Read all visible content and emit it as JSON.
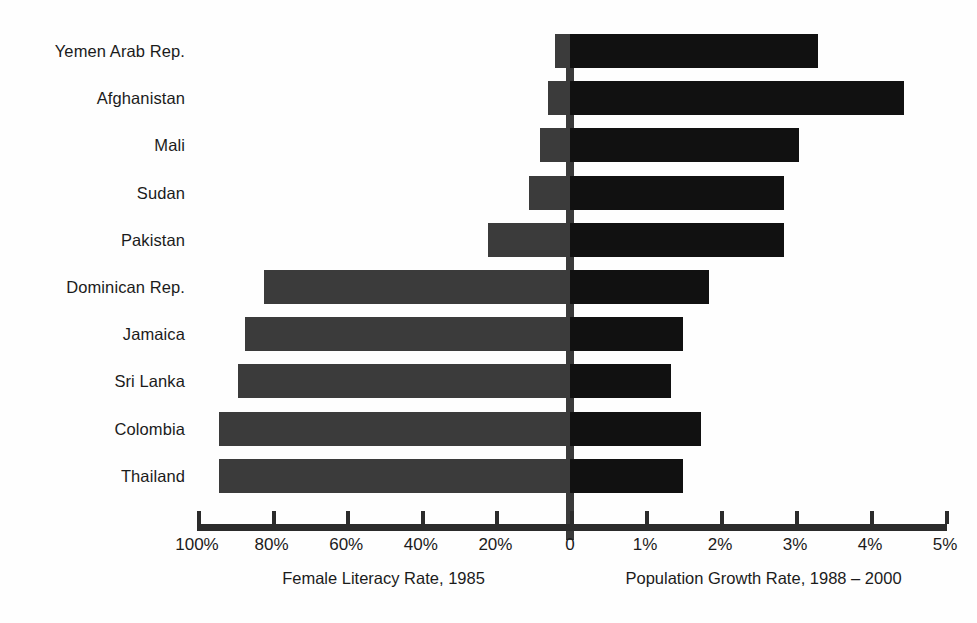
{
  "chart_data": {
    "type": "bar",
    "title": "",
    "orientation": "horizontal",
    "style": "diverging-bidirectional",
    "categories": [
      "Yemen Arab Rep.",
      "Afghanistan",
      "Mali",
      "Sudan",
      "Pakistan",
      "Dominican Rep.",
      "Jamaica",
      "Sri Lanka",
      "Colombia",
      "Thailand"
    ],
    "series": [
      {
        "name": "Female Literacy Rate, 1985",
        "side": "left",
        "unit": "%",
        "axis_label": "Female Literacy Rate, 1985",
        "color": "#3b3b3b",
        "values": [
          4,
          6,
          8,
          11,
          22,
          82,
          87,
          89,
          94,
          94
        ]
      },
      {
        "name": "Population Growth Rate, 1988 – 2000",
        "side": "right",
        "unit": "%",
        "axis_label": "Population Growth  Rate, 1988 – 2000",
        "color": "#111111",
        "values": [
          3.3,
          4.45,
          3.05,
          2.85,
          2.85,
          1.85,
          1.5,
          1.35,
          1.75,
          1.5
        ]
      }
    ],
    "left_axis": {
      "ticks": [
        100,
        80,
        60,
        40,
        20
      ],
      "tick_labels": [
        "100%",
        "80%",
        "60%",
        "40%",
        "20%"
      ],
      "range": [
        100,
        0
      ],
      "direction": "reversed"
    },
    "right_axis": {
      "ticks": [
        0,
        1,
        2,
        3,
        4,
        5
      ],
      "tick_labels": [
        "0",
        "1%",
        "2%",
        "3%",
        "4%",
        "5%"
      ],
      "range": [
        0,
        5
      ]
    },
    "grid": false,
    "legend": "none",
    "zero_label": "0"
  },
  "captions": {
    "left": "Female Literacy Rate, 1985",
    "right": "Population Growth  Rate, 1988 – 2000",
    "figure": ""
  }
}
